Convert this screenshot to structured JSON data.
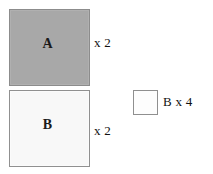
{
  "canvas": {
    "width": 213,
    "height": 174,
    "background_color": "#ffffff"
  },
  "diagram": {
    "shapes": [
      {
        "id": "square-a",
        "kind": "square",
        "label": "A",
        "fill_color": "#a8a8a8",
        "border_color": "#8c8c8c",
        "size_px": 81,
        "multiplier_text": "x 2"
      },
      {
        "id": "square-b",
        "kind": "square",
        "label": "B",
        "fill_color": "#f8f8f8",
        "border_color": "#909090",
        "size_px": 81,
        "multiplier_text": "x 2"
      },
      {
        "id": "square-b-small",
        "kind": "square",
        "label": "",
        "fill_color": "#fdfdfd",
        "border_color": "#8f8f8f",
        "size_px": 25,
        "multiplier_text": "B x 4"
      }
    ],
    "labels": {
      "square_a_letter": "A",
      "square_b_letter": "B",
      "square_a_multiplier": "x 2",
      "square_b_multiplier": "x 2",
      "small_square_caption": "B x 4"
    }
  }
}
